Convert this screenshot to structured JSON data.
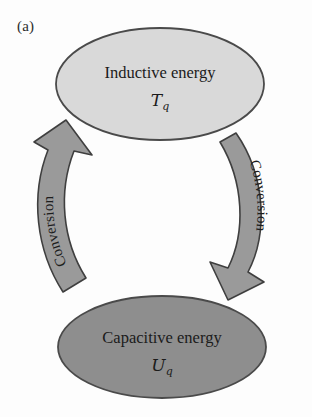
{
  "figure": {
    "panel_label": "(a)",
    "background_color": "#fdfdfd"
  },
  "nodes": [
    {
      "id": "inductive",
      "title": "Inductive energy",
      "symbol": "T",
      "subscript": "q",
      "fill_color": "#d9d9d9",
      "stroke_color": "#4a4a4a",
      "cx": 160,
      "cy": 84,
      "rx": 104,
      "ry": 56
    },
    {
      "id": "capacitive",
      "title": "Capacitive energy",
      "symbol": "U",
      "subscript": "q",
      "fill_color": "#8e8e8e",
      "stroke_color": "#4a4a4a",
      "cx": 162,
      "cy": 347,
      "rx": 104,
      "ry": 51
    }
  ],
  "arrows": [
    {
      "id": "left-arrow",
      "label": "Conversion",
      "direction": "upward",
      "from": "capacitive",
      "to": "inductive",
      "fill_color": "#9a9a9a",
      "stroke_color": "#3f3f3f"
    },
    {
      "id": "right-arrow",
      "label": "Conversion",
      "direction": "downward",
      "from": "inductive",
      "to": "capacitive",
      "fill_color": "#9a9a9a",
      "stroke_color": "#3f3f3f"
    }
  ]
}
